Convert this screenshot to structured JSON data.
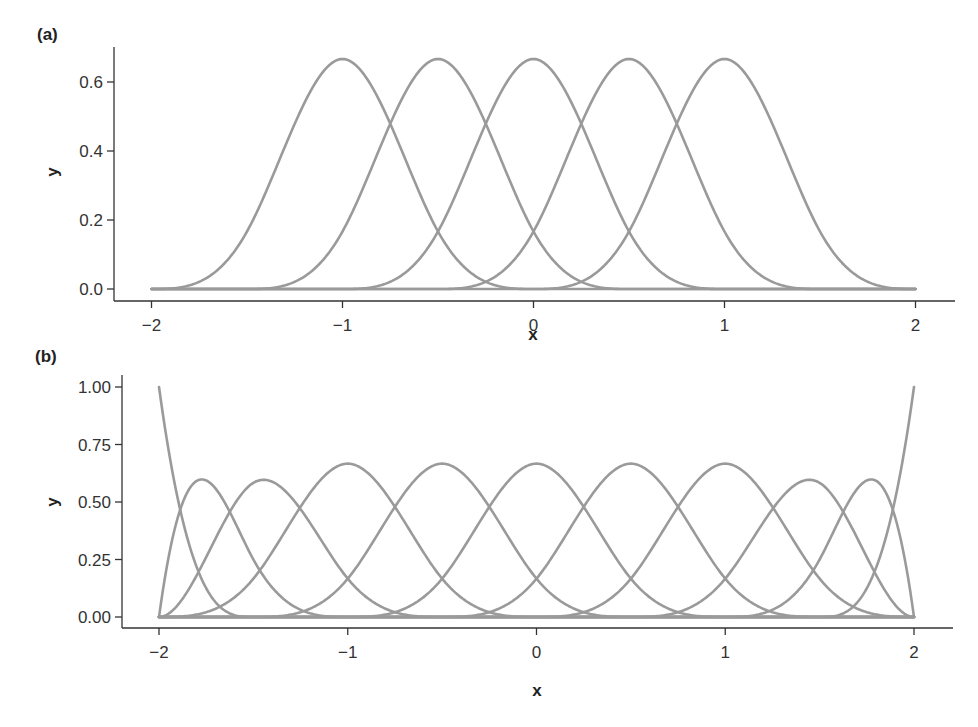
{
  "chart_data": [
    {
      "type": "line",
      "panel_label": "(a)",
      "title": "",
      "xlabel": "x",
      "ylabel": "y",
      "xlim": [
        -2,
        2
      ],
      "ylim": [
        0,
        0.7
      ],
      "x_ticks": [
        -2,
        -1,
        0,
        1,
        2
      ],
      "x_tick_labels": [
        "−2",
        "−1",
        "0",
        "1",
        "2"
      ],
      "y_ticks": [
        0.0,
        0.2,
        0.4,
        0.6
      ],
      "y_tick_labels": [
        "0.0",
        "0.2",
        "0.4",
        "0.6"
      ],
      "grid": false,
      "legend": "none",
      "curve_color": "#9a9a9a",
      "description": "Five uniform cubic B-spline basis functions, knot spacing 0.5",
      "basis": {
        "degree": 3,
        "knot_sets": [
          [
            -2.0,
            -1.5,
            -1.0,
            -0.5,
            0.0
          ],
          [
            -1.5,
            -1.0,
            -0.5,
            0.0,
            0.5
          ],
          [
            -1.0,
            -0.5,
            0.0,
            0.5,
            1.0
          ],
          [
            -0.5,
            0.0,
            0.5,
            1.0,
            1.5
          ],
          [
            0.0,
            0.5,
            1.0,
            1.5,
            2.0
          ]
        ]
      },
      "series": [
        {
          "name": "B1",
          "peak_x": -1.0,
          "peak_y": 0.667
        },
        {
          "name": "B2",
          "peak_x": -0.5,
          "peak_y": 0.667
        },
        {
          "name": "B3",
          "peak_x": 0.0,
          "peak_y": 0.667
        },
        {
          "name": "B4",
          "peak_x": 0.5,
          "peak_y": 0.667
        },
        {
          "name": "B5",
          "peak_x": 1.0,
          "peak_y": 0.667
        }
      ]
    },
    {
      "type": "line",
      "panel_label": "(b)",
      "title": "",
      "xlabel": "x",
      "ylabel": "y",
      "xlim": [
        -2,
        2
      ],
      "ylim": [
        0,
        1.0
      ],
      "x_ticks": [
        -2,
        -1,
        0,
        1,
        2
      ],
      "x_tick_labels": [
        "−2",
        "−1",
        "0",
        "1",
        "2"
      ],
      "y_ticks": [
        0.0,
        0.25,
        0.5,
        0.75,
        1.0
      ],
      "y_tick_labels": [
        "0.00",
        "0.25",
        "0.50",
        "0.75",
        "1.00"
      ],
      "grid": false,
      "legend": "none",
      "curve_color": "#9a9a9a",
      "description": "Eleven cubic B-spline basis functions with repeated boundary knots at -2 and 2",
      "basis": {
        "degree": 3,
        "knot_vector": [
          -2,
          -2,
          -2,
          -2,
          -1.5,
          -1,
          -0.5,
          0,
          0.5,
          1,
          1.5,
          2,
          2,
          2,
          2
        ]
      },
      "series": [
        {
          "name": "B1",
          "peak_x": -2.0,
          "peak_y": 1.0
        },
        {
          "name": "B2",
          "peak_x": -1.77,
          "peak_y": 0.59
        },
        {
          "name": "B3",
          "peak_x": -1.45,
          "peak_y": 0.59
        },
        {
          "name": "B4",
          "peak_x": -1.0,
          "peak_y": 0.667
        },
        {
          "name": "B5",
          "peak_x": -0.5,
          "peak_y": 0.667
        },
        {
          "name": "B6",
          "peak_x": 0.0,
          "peak_y": 0.667
        },
        {
          "name": "B7",
          "peak_x": 0.5,
          "peak_y": 0.667
        },
        {
          "name": "B8",
          "peak_x": 1.0,
          "peak_y": 0.667
        },
        {
          "name": "B9",
          "peak_x": 1.45,
          "peak_y": 0.59
        },
        {
          "name": "B10",
          "peak_x": 1.77,
          "peak_y": 0.59
        },
        {
          "name": "B11",
          "peak_x": 2.0,
          "peak_y": 1.0
        }
      ]
    }
  ]
}
